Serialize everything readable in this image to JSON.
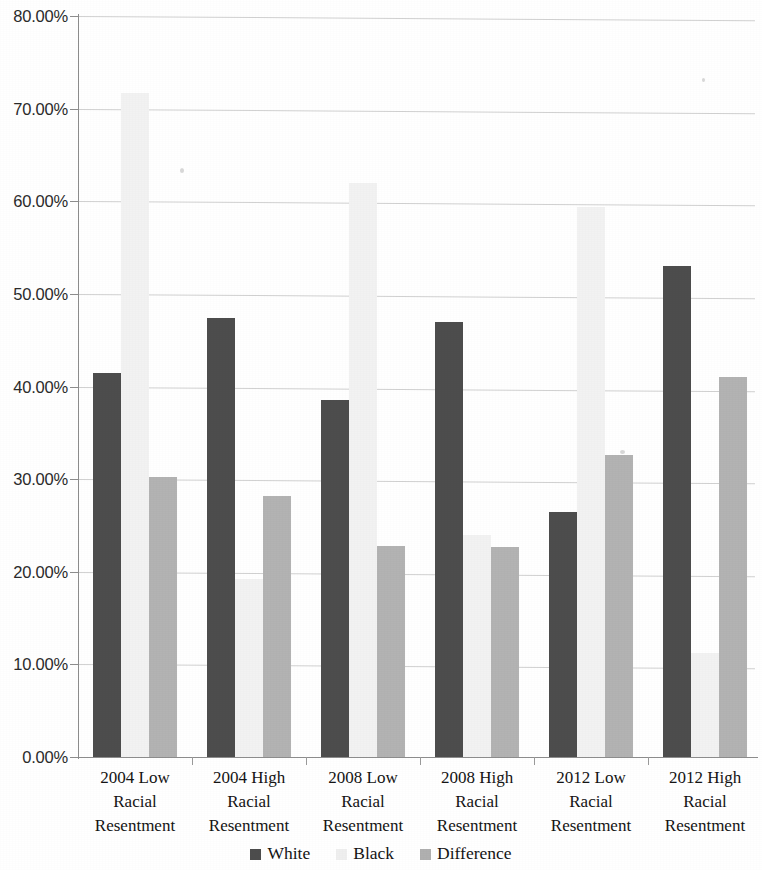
{
  "chart_data": {
    "type": "bar",
    "title": "",
    "subtitle": "",
    "xlabel": "",
    "ylabel": "",
    "ylim": [
      0,
      80
    ],
    "y_tick_step": 10,
    "y_tick_labels": [
      "0.00%",
      "10.00%",
      "20.00%",
      "30.00%",
      "40.00%",
      "50.00%",
      "60.00%",
      "70.00%",
      "80.00%"
    ],
    "y_tick_values": [
      0,
      10,
      20,
      30,
      40,
      50,
      60,
      70,
      80
    ],
    "grid": true,
    "grid_axis": "y",
    "legend_position": "bottom",
    "value_unit": "percent",
    "categories": [
      "2004 Low Racial Resentment",
      "2004 High Racial Resentment",
      "2008 Low Racial Resentment",
      "2008 High Racial Resentment",
      "2012 Low Racial Resentment",
      "2012 High Racial Resentment"
    ],
    "category_lines": [
      [
        "2004 Low",
        "Racial",
        "Resentment"
      ],
      [
        "2004 High",
        "Racial",
        "Resentment"
      ],
      [
        "2008 Low",
        "Racial",
        "Resentment"
      ],
      [
        "2008 High",
        "Racial",
        "Resentment"
      ],
      [
        "2012 Low",
        "Racial",
        "Resentment"
      ],
      [
        "2012 High",
        "Racial",
        "Resentment"
      ]
    ],
    "series": [
      {
        "name": "White",
        "color": "#4d4d4d",
        "values": [
          41.5,
          47.4,
          38.5,
          47.0,
          26.4,
          53.0
        ]
      },
      {
        "name": "Black",
        "color": "#f2f2f2",
        "values": [
          71.7,
          19.2,
          62.0,
          24.0,
          59.4,
          11.2
        ]
      },
      {
        "name": "Difference",
        "color": "#b3b3b3",
        "values": [
          30.2,
          28.2,
          22.8,
          22.7,
          32.6,
          41.0
        ]
      }
    ]
  },
  "legend": {
    "items": [
      {
        "label": "White",
        "series_key": "white-series"
      },
      {
        "label": "Black",
        "series_key": "black-series"
      },
      {
        "label": "Difference",
        "series_key": "diff-series"
      }
    ]
  }
}
